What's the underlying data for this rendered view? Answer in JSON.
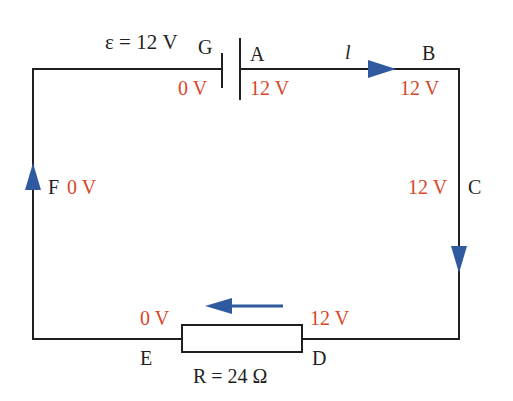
{
  "colors": {
    "wire": "#231f20",
    "voltage": "#d9462a",
    "arrow": "#2f5aa0"
  },
  "battery": {
    "emf_label": "ε = 12 V"
  },
  "current_label": "l",
  "nodes": {
    "G": {
      "name": "G",
      "voltage": "0 V"
    },
    "A": {
      "name": "A",
      "voltage": "12 V"
    },
    "B": {
      "name": "B",
      "voltage": "12 V"
    },
    "C": {
      "name": "C",
      "voltage": "12 V"
    },
    "D": {
      "name": "D",
      "voltage": "12 V"
    },
    "E": {
      "name": "E",
      "voltage": "0 V"
    },
    "F": {
      "name": "F",
      "voltage": "0 V"
    }
  },
  "resistor": {
    "label": "R = 24 Ω"
  }
}
